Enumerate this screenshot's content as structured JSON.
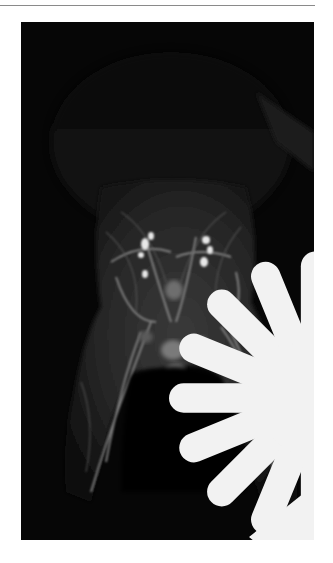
{
  "figure": {
    "type": "MR angiography image (coronal MIP)",
    "background_color": "#060606",
    "annotations": [
      {
        "id": "asterisk",
        "symbol": "asterisk",
        "color": "#f2f2f2"
      },
      {
        "id": "arrow",
        "symbol": "arrow-left",
        "color": "#f2f2f2"
      },
      {
        "id": "arrowhead",
        "symbol": "arrowhead-down-left",
        "color": "#f2f2f2"
      }
    ]
  },
  "page": {
    "background_color": "#ffffff",
    "rule_color": "#8a8a8a"
  }
}
